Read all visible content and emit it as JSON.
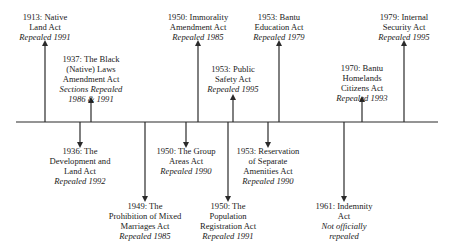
{
  "timeline": {
    "axis": {
      "x1": 16,
      "x2": 438,
      "y": 122
    },
    "events": [
      {
        "id": "native-land-act",
        "year": "1913",
        "title_lines": [
          "1913: Native",
          "Land Act"
        ],
        "status_lines": [
          "Repealed 1991"
        ],
        "direction": "up",
        "x": 45,
        "tip_y": 43,
        "label_top": 12
      },
      {
        "id": "black-native-laws-amendment-act",
        "year": "1937",
        "title_lines": [
          "1937: The Black",
          "(Native) Laws",
          "Amendment Act"
        ],
        "status_lines": [
          "Sections Repealed",
          "1986 & 1991"
        ],
        "direction": "up",
        "x": 91,
        "tip_y": 100,
        "label_top": 54
      },
      {
        "id": "immorality-amendment-act",
        "year": "1950",
        "title_lines": [
          "1950: Immorality",
          "Amendment Act"
        ],
        "status_lines": [
          "Repealed 1985"
        ],
        "direction": "up",
        "x": 198,
        "tip_y": 43,
        "label_top": 12
      },
      {
        "id": "public-safety-act",
        "year": "1953",
        "title_lines": [
          "1953: Public",
          "Safety Act"
        ],
        "status_lines": [
          "Repealed 1995"
        ],
        "direction": "up",
        "x": 233,
        "tip_y": 97,
        "label_top": 64
      },
      {
        "id": "bantu-education-act",
        "year": "1953",
        "title_lines": [
          "1953: Bantu",
          "Education Act"
        ],
        "status_lines": [
          "Repealed 1979"
        ],
        "direction": "up",
        "x": 279,
        "tip_y": 43,
        "label_top": 12
      },
      {
        "id": "bantu-homelands-citizens-act",
        "year": "1970",
        "title_lines": [
          "1970: Bantu",
          "Homelands",
          "Citizens Act"
        ],
        "status_lines": [
          "Repealed 1993"
        ],
        "direction": "up",
        "x": 362,
        "tip_y": 99,
        "label_top": 63
      },
      {
        "id": "internal-security-act",
        "year": "1979",
        "title_lines": [
          "1979: Internal",
          "Security Act"
        ],
        "status_lines": [
          "Repealed 1995"
        ],
        "direction": "up",
        "x": 404,
        "tip_y": 43,
        "label_top": 12
      },
      {
        "id": "development-and-land-act",
        "year": "1936",
        "title_lines": [
          "1936: The",
          "Development and",
          "Land Act"
        ],
        "status_lines": [
          "Repealed 1992"
        ],
        "direction": "down",
        "x": 80,
        "tip_y": 145,
        "label_top": 146
      },
      {
        "id": "prohibition-of-mixed-marriages-act",
        "year": "1949",
        "title_lines": [
          "1949: The",
          "Prohibition of Mixed",
          "Marriages Act"
        ],
        "status_lines": [
          "Repealed 1985"
        ],
        "direction": "down",
        "x": 145,
        "tip_y": 199,
        "label_top": 201
      },
      {
        "id": "group-areas-act",
        "year": "1950",
        "title_lines": [
          "1950: The Group",
          "Areas Act"
        ],
        "status_lines": [
          "Repealed 1990"
        ],
        "direction": "down",
        "x": 186,
        "tip_y": 145,
        "label_top": 146
      },
      {
        "id": "population-registration-act",
        "year": "1950",
        "title_lines": [
          "1950: The",
          "Population",
          "Registration Act"
        ],
        "status_lines": [
          "Repealed 1991"
        ],
        "direction": "down",
        "x": 228,
        "tip_y": 199,
        "label_top": 201
      },
      {
        "id": "reservation-of-separate-amenities-act",
        "year": "1953",
        "title_lines": [
          "1953: Reservation",
          "of Separate",
          "Amenities Act"
        ],
        "status_lines": [
          "Repealed 1990"
        ],
        "direction": "down",
        "x": 268,
        "tip_y": 145,
        "label_top": 146
      },
      {
        "id": "indemnity-act",
        "year": "1961",
        "title_lines": [
          "1961: Indemnity",
          "Act"
        ],
        "status_lines": [
          "Not officially",
          "repealed"
        ],
        "direction": "down",
        "x": 344,
        "tip_y": 199,
        "label_top": 201
      }
    ]
  },
  "colors": {
    "line": "#2a2a2a",
    "text": "#1a1a1a",
    "background": "#ffffff"
  }
}
